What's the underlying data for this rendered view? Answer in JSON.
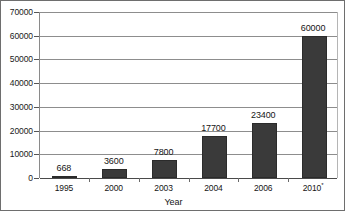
{
  "chart_data": {
    "type": "bar",
    "title": "",
    "subtitle": "",
    "xlabel": "Year",
    "ylabel": "",
    "categories": [
      "1995",
      "2000",
      "2003",
      "2004",
      "2006",
      "2010*"
    ],
    "values": [
      668,
      3600,
      7800,
      17700,
      23400,
      60000
    ],
    "data_labels": [
      "668",
      "3600",
      "7800",
      "17700",
      "23400",
      "60000"
    ],
    "ylim": [
      0,
      70000
    ],
    "ytick_values": [
      0,
      10000,
      20000,
      30000,
      40000,
      50000,
      60000,
      70000
    ],
    "ytick_labels": [
      "0",
      "10000",
      "20000",
      "30000",
      "40000",
      "50000",
      "60000",
      "70000"
    ],
    "grid": true,
    "grid_axis": "y",
    "legend": false,
    "legend_position": "none",
    "bar_color": "#3a3a3a",
    "gridline_color": "#8d8d8d",
    "axis_color": "#4a4a4a",
    "background_color": "#ffffff",
    "border_color": "#6e6e6e",
    "footnote_marker": "*"
  }
}
